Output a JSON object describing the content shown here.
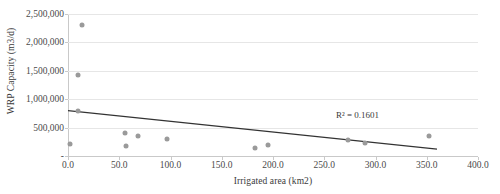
{
  "chart_data": {
    "type": "scatter",
    "title": "",
    "xlabel": "Irrigated area (km2)",
    "ylabel": "WRP Capacity (m3/d)",
    "xlim": [
      0,
      400
    ],
    "ylim": [
      0,
      2500000
    ],
    "xticks": [
      "0.0",
      "50.0",
      "100.0",
      "150.0",
      "200.0",
      "250.0",
      "300.0",
      "350.0",
      "400.0"
    ],
    "xtick_values": [
      0,
      50,
      100,
      150,
      200,
      250,
      300,
      350,
      400
    ],
    "yticks": [
      "-",
      "500,000",
      "1,000,000",
      "1,500,000",
      "2,000,000",
      "2,500,000"
    ],
    "ytick_values": [
      0,
      500000,
      1000000,
      1500000,
      2000000,
      2500000
    ],
    "grid": "horizontal",
    "legend": "none",
    "marker_color": "#9a9a9a",
    "trendline_color": "#333333",
    "points": [
      {
        "x": 14,
        "y": 2300000
      },
      {
        "x": 10,
        "y": 1420000
      },
      {
        "x": 10,
        "y": 790000
      },
      {
        "x": 2,
        "y": 210000
      },
      {
        "x": 56,
        "y": 400000
      },
      {
        "x": 68,
        "y": 350000
      },
      {
        "x": 57,
        "y": 180000
      },
      {
        "x": 97,
        "y": 300000
      },
      {
        "x": 182,
        "y": 140000
      },
      {
        "x": 195,
        "y": 190000
      },
      {
        "x": 273,
        "y": 280000
      },
      {
        "x": 290,
        "y": 230000
      },
      {
        "x": 352,
        "y": 350000
      }
    ],
    "trendline": {
      "x0": 0,
      "y0": 800000,
      "x1": 360,
      "y1": 120000
    },
    "annotations": [
      {
        "name": "r-squared",
        "text": "R² = 0.1601",
        "x": 262,
        "y": 620000
      }
    ]
  }
}
